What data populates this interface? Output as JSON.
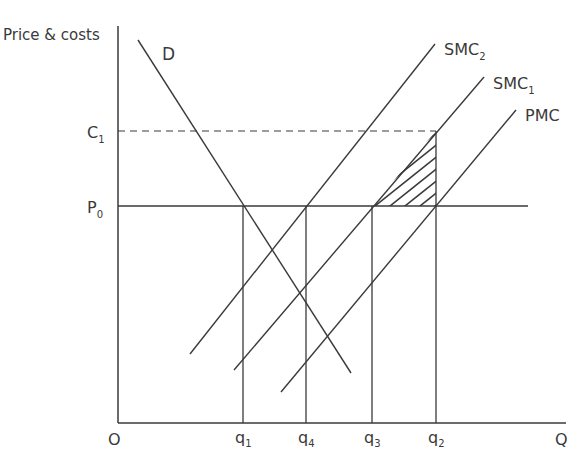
{
  "axes": {
    "y_label": "Price & costs",
    "x_label": "Q",
    "origin": "O"
  },
  "price_levels": {
    "c1": {
      "base": "C",
      "sub": "1"
    },
    "p0": {
      "base": "P",
      "sub": "0"
    }
  },
  "quantities": [
    {
      "base": "q",
      "sub": "1"
    },
    {
      "base": "q",
      "sub": "4"
    },
    {
      "base": "q",
      "sub": "3"
    },
    {
      "base": "q",
      "sub": "2"
    }
  ],
  "curves": {
    "demand": {
      "label": "D"
    },
    "smc2": {
      "base": "SMC",
      "sub": "2"
    },
    "smc1": {
      "base": "SMC",
      "sub": "1"
    },
    "pmc": {
      "label": "PMC"
    }
  },
  "colors": {
    "line": "#3a3a3a",
    "background": "#ffffff"
  }
}
